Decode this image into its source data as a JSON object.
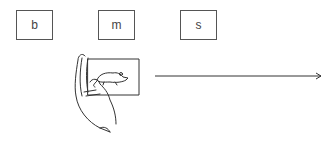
{
  "labels": {
    "box1": "b",
    "box2": "m",
    "box3": "s"
  },
  "illustration": {
    "icon": "hand-holding-mouse-card-icon"
  },
  "arrow": {
    "icon": "arrow-right-icon",
    "color": "#333333"
  }
}
